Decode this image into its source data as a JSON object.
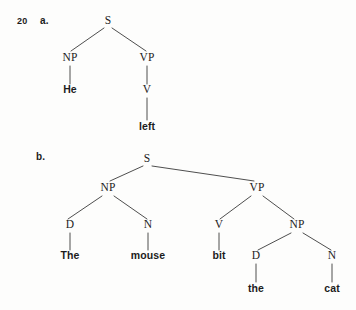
{
  "page": {
    "background_color": "#fdfdfc",
    "ink_color": "#1c1c1c",
    "branch_color": "#3a3a3a",
    "width": 356,
    "height": 310
  },
  "exercise": {
    "number": "20",
    "number_x": 17,
    "number_y": 24,
    "items": [
      {
        "letter": "a.",
        "letter_x": 40,
        "letter_y": 24,
        "sentence": "He left"
      },
      {
        "letter": "b.",
        "letter_x": 36,
        "letter_y": 160,
        "sentence": "The mouse bit the cat"
      }
    ]
  },
  "trees": [
    {
      "id": "tree-a",
      "label": "a.",
      "nodes": [
        {
          "id": "a-s",
          "text": "S",
          "kind": "category",
          "x": 108,
          "y": 24
        },
        {
          "id": "a-np",
          "text": "NP",
          "kind": "category",
          "x": 70,
          "y": 61
        },
        {
          "id": "a-vp",
          "text": "VP",
          "kind": "category",
          "x": 147,
          "y": 61
        },
        {
          "id": "a-he",
          "text": "He",
          "kind": "word",
          "x": 70,
          "y": 93
        },
        {
          "id": "a-v",
          "text": "V",
          "kind": "category",
          "x": 147,
          "y": 93
        },
        {
          "id": "a-left",
          "text": "left",
          "kind": "word",
          "x": 147,
          "y": 130
        }
      ],
      "edges": [
        {
          "from": "a-s",
          "to": "a-np",
          "x1": 104,
          "y1": 28,
          "x2": 71,
          "y2": 51
        },
        {
          "from": "a-s",
          "to": "a-vp",
          "x1": 112,
          "y1": 28,
          "x2": 146,
          "y2": 51
        },
        {
          "from": "a-np",
          "to": "a-he",
          "x1": 70,
          "y1": 66,
          "x2": 70,
          "y2": 84
        },
        {
          "from": "a-vp",
          "to": "a-v",
          "x1": 147,
          "y1": 66,
          "x2": 147,
          "y2": 84
        },
        {
          "from": "a-v",
          "to": "a-left",
          "x1": 147,
          "y1": 98,
          "x2": 147,
          "y2": 120
        }
      ]
    },
    {
      "id": "tree-b",
      "label": "b.",
      "nodes": [
        {
          "id": "b-s",
          "text": "S",
          "kind": "category",
          "x": 147,
          "y": 162
        },
        {
          "id": "b-np1",
          "text": "NP",
          "kind": "category",
          "x": 108,
          "y": 191
        },
        {
          "id": "b-vp",
          "text": "VP",
          "kind": "category",
          "x": 257,
          "y": 191
        },
        {
          "id": "b-d1",
          "text": "D",
          "kind": "category",
          "x": 70,
          "y": 228
        },
        {
          "id": "b-n1",
          "text": "N",
          "kind": "category",
          "x": 148,
          "y": 228
        },
        {
          "id": "b-v",
          "text": "V",
          "kind": "category",
          "x": 219,
          "y": 228
        },
        {
          "id": "b-np2",
          "text": "NP",
          "kind": "category",
          "x": 297,
          "y": 228
        },
        {
          "id": "b-the1",
          "text": "The",
          "kind": "word",
          "x": 70,
          "y": 259
        },
        {
          "id": "b-mouse",
          "text": "mouse",
          "kind": "word",
          "x": 148,
          "y": 259
        },
        {
          "id": "b-bit",
          "text": "bit",
          "kind": "word",
          "x": 219,
          "y": 259
        },
        {
          "id": "b-d2",
          "text": "D",
          "kind": "category",
          "x": 256,
          "y": 259
        },
        {
          "id": "b-n2",
          "text": "N",
          "kind": "category",
          "x": 332,
          "y": 259
        },
        {
          "id": "b-the2",
          "text": "the",
          "kind": "word",
          "x": 256,
          "y": 292
        },
        {
          "id": "b-cat",
          "text": "cat",
          "kind": "word",
          "x": 332,
          "y": 292
        }
      ],
      "edges": [
        {
          "from": "b-s",
          "to": "b-np1",
          "x1": 143,
          "y1": 166,
          "x2": 110,
          "y2": 181
        },
        {
          "from": "b-s",
          "to": "b-vp",
          "x1": 152,
          "y1": 166,
          "x2": 254,
          "y2": 181
        },
        {
          "from": "b-np1",
          "to": "b-d1",
          "x1": 102,
          "y1": 196,
          "x2": 68,
          "y2": 219
        },
        {
          "from": "b-np1",
          "to": "b-n1",
          "x1": 114,
          "y1": 196,
          "x2": 147,
          "y2": 219
        },
        {
          "from": "b-vp",
          "to": "b-v",
          "x1": 251,
          "y1": 196,
          "x2": 220,
          "y2": 219
        },
        {
          "from": "b-vp",
          "to": "b-np2",
          "x1": 263,
          "y1": 196,
          "x2": 294,
          "y2": 219
        },
        {
          "from": "b-d1",
          "to": "b-the1",
          "x1": 70,
          "y1": 233,
          "x2": 70,
          "y2": 250
        },
        {
          "from": "b-n1",
          "to": "b-mouse",
          "x1": 148,
          "y1": 233,
          "x2": 148,
          "y2": 250
        },
        {
          "from": "b-v",
          "to": "b-bit",
          "x1": 219,
          "y1": 233,
          "x2": 219,
          "y2": 250
        },
        {
          "from": "b-np2",
          "to": "b-d2",
          "x1": 291,
          "y1": 233,
          "x2": 258,
          "y2": 250
        },
        {
          "from": "b-np2",
          "to": "b-n2",
          "x1": 303,
          "y1": 233,
          "x2": 331,
          "y2": 250
        },
        {
          "from": "b-d2",
          "to": "b-the2",
          "x1": 256,
          "y1": 264,
          "x2": 256,
          "y2": 282
        },
        {
          "from": "b-n2",
          "to": "b-cat",
          "x1": 332,
          "y1": 264,
          "x2": 332,
          "y2": 282
        }
      ]
    }
  ]
}
